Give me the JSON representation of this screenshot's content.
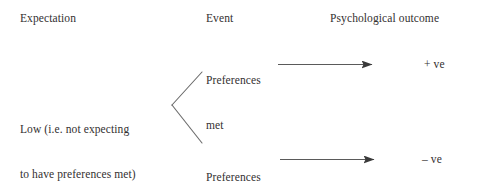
{
  "figure": {
    "background_color": "#ffffff",
    "ink_color": "#333030",
    "line_color": "#4a4a4a"
  },
  "columns": {
    "expectation_header": "Expectation",
    "event_header": "Event",
    "outcome_header": "Psychological outcome"
  },
  "nodes": {
    "expectation_low_line1": "Low (i.e. not expecting",
    "expectation_low_line2": "to have preferences met)",
    "event_met_line1": "Preferences",
    "event_met_line2": "met",
    "event_not_met_line1": "Preferences",
    "event_not_met_line2": "not met",
    "outcome_positive": "+ ve",
    "outcome_negative": "– ve"
  }
}
